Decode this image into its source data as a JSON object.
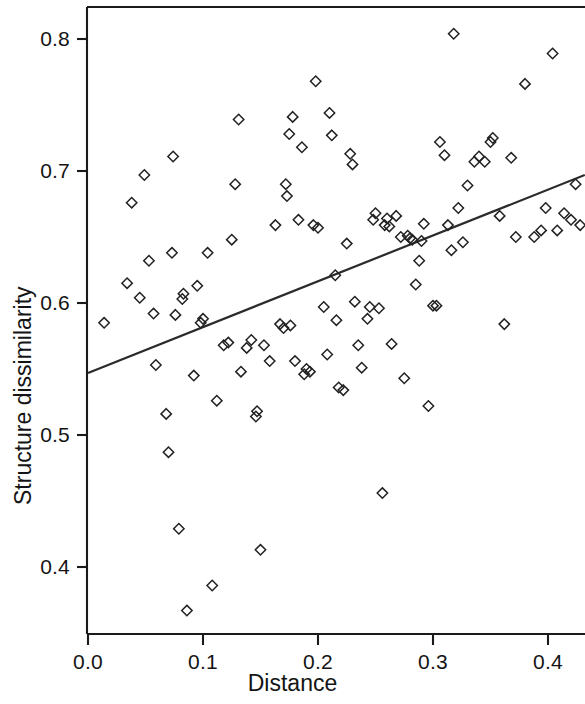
{
  "chart_data": {
    "type": "scatter",
    "title": "",
    "xlabel": "Distance",
    "ylabel": "Structure dissimilarity",
    "xlim": [
      -0.01,
      0.432
    ],
    "ylim": [
      0.355,
      0.818
    ],
    "xticks": [
      0.0,
      0.1,
      0.2,
      0.3,
      0.4
    ],
    "xtick_labels": [
      "0.0",
      "0.1",
      "0.2",
      "0.3",
      "0.4"
    ],
    "yticks": [
      0.4,
      0.5,
      0.6,
      0.7,
      0.8
    ],
    "ytick_labels": [
      "0.4",
      "0.5",
      "0.6",
      "0.7",
      "0.8"
    ],
    "grid": false,
    "legend": null,
    "marker": "open-diamond",
    "marker_color": "#222222",
    "point_count": 118,
    "points": [
      {
        "x": 0.014,
        "y": 0.585
      },
      {
        "x": 0.034,
        "y": 0.615
      },
      {
        "x": 0.038,
        "y": 0.676
      },
      {
        "x": 0.045,
        "y": 0.604
      },
      {
        "x": 0.049,
        "y": 0.697
      },
      {
        "x": 0.053,
        "y": 0.632
      },
      {
        "x": 0.057,
        "y": 0.592
      },
      {
        "x": 0.059,
        "y": 0.553
      },
      {
        "x": 0.068,
        "y": 0.516
      },
      {
        "x": 0.07,
        "y": 0.487
      },
      {
        "x": 0.073,
        "y": 0.638
      },
      {
        "x": 0.074,
        "y": 0.711
      },
      {
        "x": 0.076,
        "y": 0.591
      },
      {
        "x": 0.079,
        "y": 0.429
      },
      {
        "x": 0.082,
        "y": 0.603
      },
      {
        "x": 0.083,
        "y": 0.607
      },
      {
        "x": 0.086,
        "y": 0.367
      },
      {
        "x": 0.092,
        "y": 0.545
      },
      {
        "x": 0.095,
        "y": 0.613
      },
      {
        "x": 0.098,
        "y": 0.585
      },
      {
        "x": 0.1,
        "y": 0.588
      },
      {
        "x": 0.104,
        "y": 0.638
      },
      {
        "x": 0.108,
        "y": 0.386
      },
      {
        "x": 0.112,
        "y": 0.526
      },
      {
        "x": 0.118,
        "y": 0.568
      },
      {
        "x": 0.122,
        "y": 0.57
      },
      {
        "x": 0.125,
        "y": 0.648
      },
      {
        "x": 0.128,
        "y": 0.69
      },
      {
        "x": 0.131,
        "y": 0.739
      },
      {
        "x": 0.133,
        "y": 0.548
      },
      {
        "x": 0.138,
        "y": 0.566
      },
      {
        "x": 0.142,
        "y": 0.572
      },
      {
        "x": 0.146,
        "y": 0.514
      },
      {
        "x": 0.147,
        "y": 0.518
      },
      {
        "x": 0.15,
        "y": 0.413
      },
      {
        "x": 0.153,
        "y": 0.568
      },
      {
        "x": 0.158,
        "y": 0.556
      },
      {
        "x": 0.163,
        "y": 0.659
      },
      {
        "x": 0.167,
        "y": 0.584
      },
      {
        "x": 0.17,
        "y": 0.581
      },
      {
        "x": 0.172,
        "y": 0.69
      },
      {
        "x": 0.173,
        "y": 0.681
      },
      {
        "x": 0.175,
        "y": 0.728
      },
      {
        "x": 0.176,
        "y": 0.583
      },
      {
        "x": 0.178,
        "y": 0.741
      },
      {
        "x": 0.18,
        "y": 0.556
      },
      {
        "x": 0.183,
        "y": 0.663
      },
      {
        "x": 0.186,
        "y": 0.718
      },
      {
        "x": 0.188,
        "y": 0.546
      },
      {
        "x": 0.19,
        "y": 0.55
      },
      {
        "x": 0.193,
        "y": 0.548
      },
      {
        "x": 0.196,
        "y": 0.659
      },
      {
        "x": 0.198,
        "y": 0.768
      },
      {
        "x": 0.2,
        "y": 0.657
      },
      {
        "x": 0.205,
        "y": 0.597
      },
      {
        "x": 0.208,
        "y": 0.561
      },
      {
        "x": 0.21,
        "y": 0.744
      },
      {
        "x": 0.212,
        "y": 0.727
      },
      {
        "x": 0.215,
        "y": 0.621
      },
      {
        "x": 0.216,
        "y": 0.587
      },
      {
        "x": 0.218,
        "y": 0.536
      },
      {
        "x": 0.222,
        "y": 0.534
      },
      {
        "x": 0.225,
        "y": 0.645
      },
      {
        "x": 0.228,
        "y": 0.713
      },
      {
        "x": 0.23,
        "y": 0.705
      },
      {
        "x": 0.232,
        "y": 0.601
      },
      {
        "x": 0.235,
        "y": 0.568
      },
      {
        "x": 0.238,
        "y": 0.551
      },
      {
        "x": 0.243,
        "y": 0.588
      },
      {
        "x": 0.245,
        "y": 0.597
      },
      {
        "x": 0.248,
        "y": 0.663
      },
      {
        "x": 0.25,
        "y": 0.668
      },
      {
        "x": 0.253,
        "y": 0.596
      },
      {
        "x": 0.256,
        "y": 0.456
      },
      {
        "x": 0.258,
        "y": 0.659
      },
      {
        "x": 0.26,
        "y": 0.664
      },
      {
        "x": 0.262,
        "y": 0.658
      },
      {
        "x": 0.264,
        "y": 0.569
      },
      {
        "x": 0.268,
        "y": 0.666
      },
      {
        "x": 0.272,
        "y": 0.65
      },
      {
        "x": 0.275,
        "y": 0.543
      },
      {
        "x": 0.278,
        "y": 0.651
      },
      {
        "x": 0.28,
        "y": 0.649
      },
      {
        "x": 0.282,
        "y": 0.648
      },
      {
        "x": 0.285,
        "y": 0.614
      },
      {
        "x": 0.288,
        "y": 0.632
      },
      {
        "x": 0.29,
        "y": 0.647
      },
      {
        "x": 0.292,
        "y": 0.66
      },
      {
        "x": 0.296,
        "y": 0.522
      },
      {
        "x": 0.3,
        "y": 0.598
      },
      {
        "x": 0.303,
        "y": 0.598
      },
      {
        "x": 0.306,
        "y": 0.722
      },
      {
        "x": 0.31,
        "y": 0.712
      },
      {
        "x": 0.313,
        "y": 0.659
      },
      {
        "x": 0.316,
        "y": 0.64
      },
      {
        "x": 0.318,
        "y": 0.804
      },
      {
        "x": 0.322,
        "y": 0.672
      },
      {
        "x": 0.326,
        "y": 0.646
      },
      {
        "x": 0.33,
        "y": 0.689
      },
      {
        "x": 0.336,
        "y": 0.707
      },
      {
        "x": 0.34,
        "y": 0.711
      },
      {
        "x": 0.345,
        "y": 0.707
      },
      {
        "x": 0.35,
        "y": 0.722
      },
      {
        "x": 0.352,
        "y": 0.725
      },
      {
        "x": 0.358,
        "y": 0.666
      },
      {
        "x": 0.362,
        "y": 0.584
      },
      {
        "x": 0.368,
        "y": 0.71
      },
      {
        "x": 0.372,
        "y": 0.65
      },
      {
        "x": 0.38,
        "y": 0.766
      },
      {
        "x": 0.388,
        "y": 0.65
      },
      {
        "x": 0.394,
        "y": 0.655
      },
      {
        "x": 0.398,
        "y": 0.672
      },
      {
        "x": 0.404,
        "y": 0.789
      },
      {
        "x": 0.408,
        "y": 0.655
      },
      {
        "x": 0.414,
        "y": 0.668
      },
      {
        "x": 0.42,
        "y": 0.663
      },
      {
        "x": 0.424,
        "y": 0.69
      },
      {
        "x": 0.428,
        "y": 0.659
      }
    ],
    "trendline": {
      "type": "linear-fit",
      "x_start": 0.0,
      "y_start": 0.547,
      "x_end": 0.432,
      "y_end": 0.697,
      "slope": 0.347,
      "intercept": 0.547,
      "color": "#2b2b2b"
    }
  },
  "axes": {
    "frame_color": "#1a1a1a",
    "tick_color": "#1a1a1a"
  }
}
